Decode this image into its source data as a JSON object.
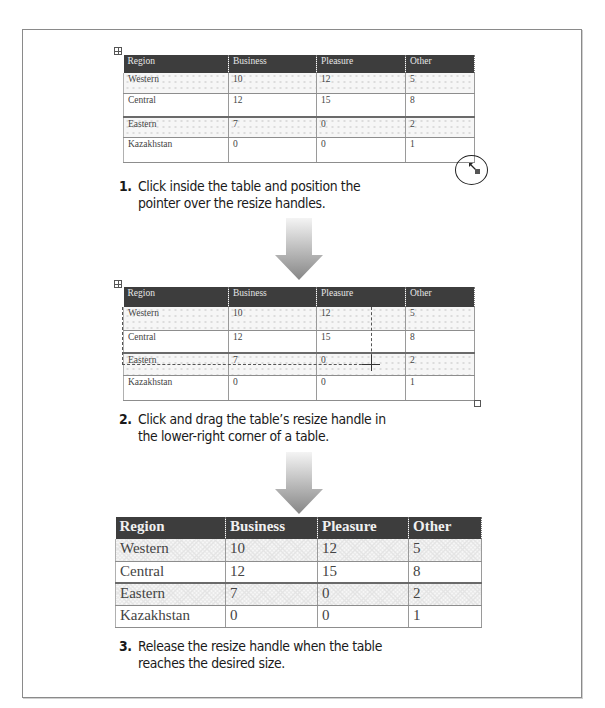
{
  "table": {
    "headers": [
      "Region",
      "Business",
      "Pleasure",
      "Other"
    ],
    "rows": [
      [
        "Western",
        "10",
        "12",
        "5"
      ],
      [
        "Central",
        "12",
        "15",
        "8"
      ],
      [
        "Eastern",
        "7",
        "0",
        "2"
      ],
      [
        "Kazakhstan",
        "0",
        "0",
        "1"
      ]
    ]
  },
  "steps": [
    {
      "number": "1.",
      "line1": "Click inside the table and position the",
      "line2": "pointer over the resize handles."
    },
    {
      "number": "2.",
      "line1": "Click and drag the table’s resize handle in",
      "line2": "the lower-right corner of a table."
    },
    {
      "number": "3.",
      "line1": "Release the resize handle when the table",
      "line2": "reaches the desired size."
    }
  ],
  "icons": {
    "move_handle": "table-move-handle-icon",
    "resize_handle": "table-resize-handle-icon",
    "arrow": "down-arrow-icon",
    "zoom_callout": "magnify-circle-icon"
  },
  "colors": {
    "header_bg": "#3d3d3d",
    "header_text": "#e6e6e6",
    "arrow_top": "#f2f2f2",
    "arrow_bottom": "#8a8a8a"
  }
}
